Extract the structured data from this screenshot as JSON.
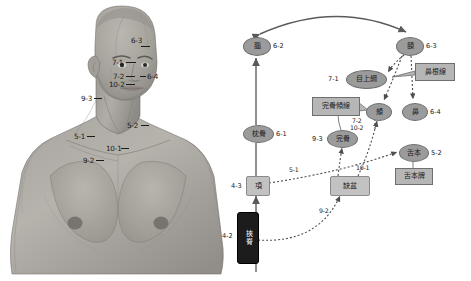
{
  "figure": {
    "labels": [
      {
        "code": "6-3",
        "x": 131,
        "y": 40,
        "tick": {
          "x": 141,
          "y": 46,
          "w": 9
        }
      },
      {
        "code": "7-1",
        "x": 113,
        "y": 59,
        "tick": {
          "x": 126,
          "y": 62,
          "w": 10
        }
      },
      {
        "code": "7-2",
        "x": 113,
        "y": 73,
        "tick": {
          "x": 126,
          "y": 76,
          "w": 9
        }
      },
      {
        "code": "10-2",
        "x": 110,
        "y": 81,
        "tick": {
          "x": 126,
          "y": 84,
          "w": 9
        }
      },
      {
        "code": "6-4",
        "x": 146,
        "y": 73,
        "tick": {
          "x": 140,
          "y": 76,
          "w": 6
        }
      },
      {
        "code": "9-3",
        "x": 82,
        "y": 95,
        "tick": {
          "x": 94,
          "y": 98,
          "w": 8
        }
      },
      {
        "code": "5-2",
        "x": 128,
        "y": 122,
        "tick": {
          "x": 141,
          "y": 125,
          "w": 8
        }
      },
      {
        "code": "5-1",
        "x": 75,
        "y": 133,
        "tick": {
          "x": 87,
          "y": 136,
          "w": 8
        }
      },
      {
        "code": "10-1",
        "x": 107,
        "y": 145,
        "tick": {
          "x": 121,
          "y": 148,
          "w": 8
        }
      },
      {
        "code": "9-2",
        "x": 84,
        "y": 157,
        "tick": {
          "x": 96,
          "y": 160,
          "w": 8
        }
      }
    ]
  },
  "diagram": {
    "nodes": [
      {
        "id": "nao",
        "label": "腦",
        "code": "6-2",
        "shape": "ellipse",
        "x": 11,
        "y": 37,
        "w": 26,
        "h": 17,
        "code_x": 41,
        "code_y": 42
      },
      {
        "id": "e",
        "label": "頟",
        "code": "6-3",
        "shape": "ellipse",
        "x": 164,
        "y": 37,
        "w": 26,
        "h": 17,
        "code_x": 194,
        "code_y": 42
      },
      {
        "id": "mushangang",
        "label": "目上綱",
        "code": "7-1",
        "shape": "ellipse",
        "x": 114,
        "y": 70,
        "w": 39,
        "h": 17,
        "code_x": 96,
        "code_y": 75
      },
      {
        "id": "bigenxian",
        "label": "鼻根線",
        "code": "",
        "shape": "callout",
        "x": 183,
        "y": 63,
        "w": 38,
        "h": 16,
        "code_x": 0,
        "code_y": 0
      },
      {
        "id": "jia",
        "label": "頰",
        "code": "",
        "shape": "ellipse",
        "x": 134,
        "y": 103,
        "w": 24,
        "h": 16,
        "code_x": 0,
        "code_y": 0
      },
      {
        "id": "bi",
        "label": "鼻",
        "code": "6-4",
        "shape": "ellipse",
        "x": 170,
        "y": 103,
        "w": 24,
        "h": 16,
        "code_x": 198,
        "code_y": 108
      },
      {
        "id": "wanguqx",
        "label": "完骨傾線",
        "code": "",
        "shape": "callout",
        "x": 80,
        "y": 97,
        "w": 46,
        "h": 17,
        "code_x": 0,
        "code_y": 0
      },
      {
        "id": "wangu",
        "label": "完骨",
        "code": "9-3",
        "shape": "ellipse",
        "x": 95,
        "y": 130,
        "w": 29,
        "h": 16,
        "code_x": 81,
        "code_y": 135
      },
      {
        "id": "zhengu",
        "label": "枕骨",
        "code": "6-1",
        "shape": "ellipse",
        "x": 11,
        "y": 125,
        "w": 29,
        "h": 16,
        "code_x": 44,
        "code_y": 130
      },
      {
        "id": "sheben",
        "label": "舌本",
        "code": "5-2",
        "shape": "ellipse",
        "x": 167,
        "y": 144,
        "w": 28,
        "h": 16,
        "code_x": 199,
        "code_y": 149
      },
      {
        "id": "shebenpai",
        "label": "舌本牌",
        "code": "",
        "shape": "callout",
        "x": 163,
        "y": 168,
        "w": 36,
        "h": 15,
        "code_x": 0,
        "code_y": 0
      },
      {
        "id": "xiang",
        "label": "項",
        "code": "4-3",
        "shape": "rect",
        "x": 14,
        "y": 176,
        "w": 22,
        "h": 18,
        "code_x": 0,
        "code_y": 182
      },
      {
        "id": "quepen",
        "label": "缺盆",
        "code": "",
        "shape": "rect",
        "x": 98,
        "y": 176,
        "w": 38,
        "h": 18,
        "code_x": 0,
        "code_y": 0
      },
      {
        "id": "jiaji",
        "label": "挾脊",
        "code": "4-2",
        "shape": "dark",
        "x": 5,
        "y": 212,
        "w": 20,
        "h": 50,
        "code_x": 0,
        "code_y": 232
      }
    ],
    "edge_labels": [
      {
        "text": "7-2",
        "x": 120,
        "y": 117
      },
      {
        "text": "10-2",
        "x": 118,
        "y": 124
      },
      {
        "text": "5-1",
        "x": 57,
        "y": 168
      },
      {
        "text": "10-1",
        "x": 124,
        "y": 166
      },
      {
        "text": "9-2",
        "x": 87,
        "y": 209
      }
    ]
  }
}
